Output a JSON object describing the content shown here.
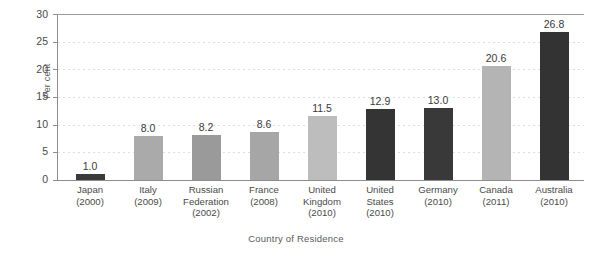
{
  "chart_data": {
    "type": "bar",
    "title": "",
    "xlabel": "Country of Residence",
    "ylabel": "Per cent",
    "ylim": [
      0,
      30
    ],
    "ytick_values": [
      0,
      5,
      10,
      15,
      20,
      25,
      30
    ],
    "ytick_labels": [
      "0",
      "5",
      "10",
      "15",
      "20",
      "25",
      "30"
    ],
    "grid": "horizontal-dotted",
    "legend": "none",
    "categories": [
      "Japan\n(2000)",
      "Italy\n(2009)",
      "Russian Federation\n(2002)",
      "France\n(2008)",
      "United Kingdom\n(2010)",
      "United States\n(2010)",
      "Germany\n(2010)",
      "Canada\n(2011)",
      "Australia\n(2010)"
    ],
    "values": [
      1.0,
      8.0,
      8.2,
      8.6,
      11.5,
      12.9,
      13.0,
      20.6,
      26.8
    ],
    "data_labels": [
      "1.0",
      "8.0",
      "8.2",
      "8.6",
      "11.5",
      "12.9",
      "13.0",
      "20.6",
      "26.8"
    ],
    "bar_colors": [
      "#3a3a3a",
      "#aaaaaa",
      "#9a9a9a",
      "#a6a6a6",
      "#bdbdbd",
      "#343434",
      "#393939",
      "#b4b4b4",
      "#333333"
    ]
  },
  "bars": [
    {
      "country": "Japan",
      "year": "(2000)",
      "value": 1.0,
      "label": "1.0",
      "color": "#3a3a3a"
    },
    {
      "country": "Italy",
      "year": "(2009)",
      "value": 8.0,
      "label": "8.0",
      "color": "#aaaaaa"
    },
    {
      "country": "Russian",
      "country2": "Federation",
      "year": "(2002)",
      "value": 8.2,
      "label": "8.2",
      "color": "#9a9a9a"
    },
    {
      "country": "France",
      "year": "(2008)",
      "value": 8.6,
      "label": "8.6",
      "color": "#a6a6a6"
    },
    {
      "country": "United",
      "country2": "Kingdom",
      "year": "(2010)",
      "value": 11.5,
      "label": "11.5",
      "color": "#bdbdbd"
    },
    {
      "country": "United",
      "country2": "States",
      "year": "(2010)",
      "value": 12.9,
      "label": "12.9",
      "color": "#343434"
    },
    {
      "country": "Germany",
      "year": "(2010)",
      "value": 13.0,
      "label": "13.0",
      "color": "#393939"
    },
    {
      "country": "Canada",
      "year": "(2011)",
      "value": 20.6,
      "label": "20.6",
      "color": "#b4b4b4"
    },
    {
      "country": "Australia",
      "year": "(2010)",
      "value": 26.8,
      "label": "26.8",
      "color": "#333333"
    }
  ],
  "axes": {
    "y_title": "Per cent",
    "x_title": "Country of Residence",
    "yticks": [
      "30",
      "25",
      "20",
      "15",
      "10",
      "5",
      "0"
    ]
  }
}
